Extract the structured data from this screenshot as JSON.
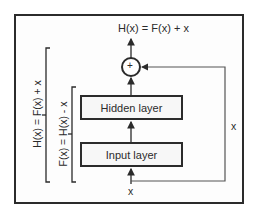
{
  "diagram": {
    "title_output": "H(x) = F(x) + x",
    "adder_symbol": "+",
    "layers": [
      {
        "label": "Hidden layer"
      },
      {
        "label": "Input layer"
      }
    ],
    "input_label": "x",
    "skip_connection_label": "x",
    "brackets": {
      "outer": "H(x) = F(x) + x",
      "inner": "F(x) = H(x) - x"
    },
    "colors": {
      "stroke": "#2b2b2b",
      "skip_line": "#555555",
      "box_fill": "#f7f7f7",
      "background": "#ffffff"
    }
  }
}
